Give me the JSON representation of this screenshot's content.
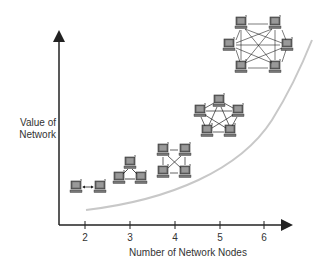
{
  "figure": {
    "type": "concept-diagram",
    "title": "",
    "ylabel_line1": "Value of",
    "ylabel_line2": "Network",
    "xlabel": "Number of Network Nodes",
    "x_ticks": [
      "2",
      "3",
      "4",
      "5",
      "6"
    ],
    "curve_color": "#c8c8c8",
    "axis_color": "#222222"
  },
  "networks": [
    {
      "nodes": 2,
      "topology": "pair",
      "label": "2-node network"
    },
    {
      "nodes": 3,
      "topology": "triangle",
      "label": "3-node network"
    },
    {
      "nodes": 4,
      "topology": "full-mesh",
      "label": "4-node network"
    },
    {
      "nodes": 5,
      "topology": "full-mesh",
      "label": "5-node network"
    },
    {
      "nodes": 6,
      "topology": "full-mesh",
      "label": "6-node network"
    }
  ]
}
